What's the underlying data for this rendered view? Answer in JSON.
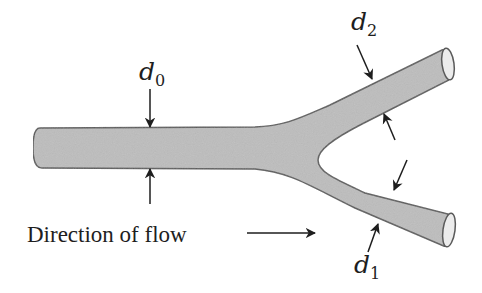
{
  "diagram": {
    "labels": {
      "d0": {
        "symbol": "d",
        "subscript": "0"
      },
      "d1": {
        "symbol": "d",
        "subscript": "1"
      },
      "d2": {
        "symbol": "d",
        "subscript": "2"
      }
    },
    "caption": "Direction of flow",
    "colors": {
      "pipe_fill": "#bdbdbd",
      "pipe_stroke": "#5a5a5a",
      "pipe_end_fill": "#ececec",
      "arrow": "#1e1e1e",
      "background": "#ffffff"
    },
    "parts": [
      {
        "name": "main pipe",
        "diameter_label": "d0"
      },
      {
        "name": "lower branch",
        "diameter_label": "d1"
      },
      {
        "name": "upper branch",
        "diameter_label": "d2"
      }
    ]
  }
}
